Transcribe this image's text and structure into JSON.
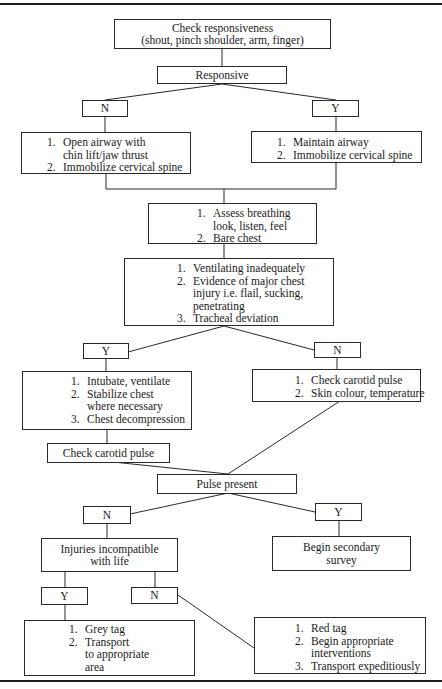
{
  "flowchart": {
    "start": {
      "title": "Check responsiveness",
      "subtitle": "(shout, pinch shoulder, arm, finger)"
    },
    "decision_responsive": {
      "label": "Responsive",
      "no": "N",
      "yes": "Y"
    },
    "airway_no": {
      "items": [
        {
          "num": "1.",
          "lines": [
            "Open airway with",
            "chin lift/jaw thrust"
          ]
        },
        {
          "num": "2.",
          "lines": [
            "Immobilize cervical spine"
          ]
        }
      ]
    },
    "airway_yes": {
      "items": [
        {
          "num": "1.",
          "lines": [
            "Maintain airway"
          ]
        },
        {
          "num": "2.",
          "lines": [
            "Immobilize cervical spine"
          ]
        }
      ]
    },
    "breathing": {
      "items": [
        {
          "num": "1.",
          "lines": [
            "Assess breathing",
            "look, listen, feel"
          ]
        },
        {
          "num": "2.",
          "lines": [
            "Bare chest"
          ]
        }
      ]
    },
    "chest_decision": {
      "items": [
        {
          "num": "1.",
          "lines": [
            "Ventilating inadequately"
          ]
        },
        {
          "num": "2.",
          "lines": [
            "Evidence of major chest",
            "injury i.e. flail, sucking,",
            "penetrating"
          ]
        },
        {
          "num": "3.",
          "lines": [
            "Tracheal deviation"
          ]
        }
      ],
      "yes": "Y",
      "no": "N"
    },
    "chest_yes": {
      "items": [
        {
          "num": "1.",
          "lines": [
            "Intubate, ventilate"
          ]
        },
        {
          "num": "2.",
          "lines": [
            "Stabilize chest",
            "where necessary"
          ]
        },
        {
          "num": "3.",
          "lines": [
            "Chest decompression"
          ]
        }
      ]
    },
    "chest_no": {
      "items": [
        {
          "num": "1.",
          "lines": [
            "Check carotid pulse"
          ]
        },
        {
          "num": "2.",
          "lines": [
            "Skin colour, temperature"
          ]
        }
      ]
    },
    "check_carotid": {
      "label": "Check carotid pulse"
    },
    "pulse_decision": {
      "label": "Pulse present",
      "no": "N",
      "yes": "Y"
    },
    "secondary_survey": {
      "lines": [
        "Begin secondary",
        "survey"
      ]
    },
    "injuries_decision": {
      "lines": [
        "Injuries incompatible",
        "with life"
      ],
      "yes": "Y",
      "no": "N"
    },
    "grey_tag": {
      "items": [
        {
          "num": "1.",
          "lines": [
            "Grey tag"
          ]
        },
        {
          "num": "2.",
          "lines": [
            "Transport",
            "to appropriate",
            "area"
          ]
        }
      ]
    },
    "red_tag": {
      "items": [
        {
          "num": "1.",
          "lines": [
            "Red tag"
          ]
        },
        {
          "num": "2.",
          "lines": [
            "Begin appropriate",
            "interventions"
          ]
        },
        {
          "num": "3.",
          "lines": [
            "Transport expeditiously"
          ]
        }
      ]
    }
  }
}
